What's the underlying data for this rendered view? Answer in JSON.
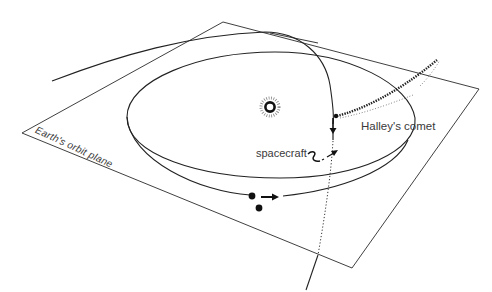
{
  "diagram": {
    "labels": {
      "plane": "Earth's orbit plane",
      "spacecraft": "spacecraft",
      "comet": "Halley's comet"
    },
    "elements": {
      "sun": "sun-icon",
      "earth": "earth-dot",
      "launch_point": "spacecraft-launch-dot",
      "earth_orbit": "earth-orbit-ellipse",
      "spacecraft_orbit": "spacecraft-transfer-orbit",
      "comet_orbit": "halley-comet-orbit",
      "comet_tail": "comet-tail",
      "plane": "earth-orbit-plane"
    },
    "colors": {
      "line": "#222222",
      "text": "#3a3a3a",
      "background": "#ffffff"
    }
  }
}
